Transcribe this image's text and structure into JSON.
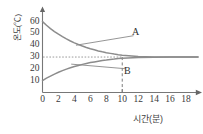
{
  "chart_data": {
    "type": "line",
    "title": "",
    "xlabel": "시간(분)",
    "ylabel": "온도(℃)",
    "xlim": [
      0,
      19.5
    ],
    "ylim": [
      0,
      66
    ],
    "xticks": [
      "0",
      "2",
      "4",
      "6",
      "8",
      "10",
      "12",
      "14",
      "16",
      "18"
    ],
    "xtick_values": [
      0,
      2,
      4,
      6,
      8,
      10,
      12,
      14,
      16,
      18
    ],
    "yticks": [
      "10",
      "20",
      "30",
      "40",
      "50",
      "60"
    ],
    "ytick_values": [
      10,
      20,
      30,
      40,
      50,
      60
    ],
    "grid": false,
    "legend": "none",
    "equilibrium_temperature": 30,
    "equilibrium_time": 10,
    "annotations": [
      {
        "label": "A",
        "x": 11.6,
        "y": 51,
        "points_to": {
          "x": 4.2,
          "y": 40
        }
      },
      {
        "label": "B",
        "x": 10.6,
        "y": 18,
        "points_to": {
          "x": 3.6,
          "y": 24
        }
      }
    ],
    "guides": [
      {
        "name": "horizontal-dotted-equilibrium",
        "style": "dotted",
        "y": 30,
        "x_from": 0,
        "x_to": 10
      },
      {
        "name": "vertical-dashed-equilibrium",
        "style": "dashed",
        "x": 10,
        "y_from": 0,
        "y_to": 30
      }
    ],
    "series": [
      {
        "name": "A",
        "start_value": 60,
        "end_value": 30,
        "x": [
          0,
          0.5,
          1,
          1.5,
          2,
          2.5,
          3,
          3.5,
          4,
          4.5,
          5,
          5.5,
          6,
          6.5,
          7,
          7.5,
          8,
          8.5,
          9,
          9.5,
          10,
          12,
          14,
          16,
          18,
          19.5
        ],
        "values": [
          60,
          56.9,
          54.1,
          51.6,
          49.3,
          47.2,
          45.3,
          43.6,
          42.0,
          40.6,
          39.3,
          38.1,
          37.0,
          36.1,
          35.2,
          34.4,
          33.7,
          33.1,
          32.5,
          32.0,
          31.6,
          30.4,
          30.1,
          30.0,
          30.0,
          30.0
        ]
      },
      {
        "name": "B",
        "start_value": 10,
        "end_value": 30,
        "x": [
          0,
          0.5,
          1,
          1.5,
          2,
          2.5,
          3,
          3.5,
          4,
          4.5,
          5,
          5.5,
          6,
          6.5,
          7,
          7.5,
          8,
          8.5,
          9,
          9.5,
          10,
          12,
          14,
          16,
          18,
          19.5
        ],
        "values": [
          10,
          12.1,
          13.9,
          15.6,
          17.1,
          18.5,
          19.8,
          20.9,
          22.0,
          22.9,
          23.8,
          24.6,
          25.3,
          25.9,
          26.5,
          27.1,
          27.5,
          28.0,
          28.3,
          28.7,
          29.0,
          29.7,
          29.9,
          30.0,
          30.0,
          30.0
        ]
      }
    ]
  }
}
